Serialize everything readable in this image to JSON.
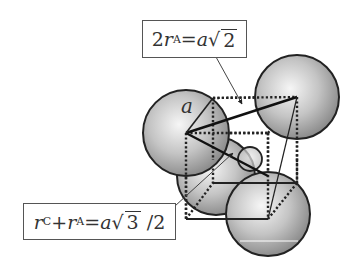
{
  "diagram": {
    "labels": {
      "face_diagonal": {
        "lhs_coeff": "2",
        "lhs_var": "r",
        "lhs_sub": "A",
        "eq": "=",
        "rhs_var": "a",
        "sqrt_sym": "√",
        "sqrt_arg": "2",
        "full_text": "2rA=a√2"
      },
      "body_diagonal": {
        "term1_var": "r",
        "term1_sub": "C",
        "plus": "+",
        "term2_var": "r",
        "term2_sub": "A",
        "eq": "=",
        "rhs_var": "a",
        "sqrt_sym": "√",
        "sqrt_arg": "3",
        "tail": " /2",
        "full_text": "rC+rA=a√3 /2"
      },
      "edge": "a"
    },
    "colors": {
      "sphere_light": "#f4f4f4",
      "sphere_dark": "#8e8e8e",
      "outline": "#222222",
      "box_border": "#555555"
    }
  }
}
